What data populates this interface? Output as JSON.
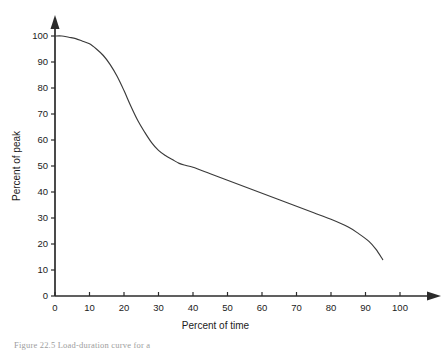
{
  "figure": {
    "caption_partial": "Figure 22.5   Load-duration curve for a",
    "background_color": "#ffffff",
    "line_color": "#3a3a3a",
    "axis_color": "#2b2b2b"
  },
  "chart_data": {
    "type": "line",
    "title": "",
    "subtitle": "",
    "xlabel": "Percent of time",
    "ylabel": "Percent of peak",
    "xlim": [
      0,
      100
    ],
    "ylim": [
      0,
      100
    ],
    "xticks": [
      0,
      10,
      20,
      30,
      40,
      50,
      60,
      70,
      80,
      90,
      100
    ],
    "yticks": [
      0,
      10,
      20,
      30,
      40,
      50,
      60,
      70,
      80,
      90,
      100
    ],
    "xtick_labels": [
      "0",
      "10",
      "20",
      "30",
      "40",
      "50",
      "60",
      "70",
      "80",
      "90",
      "100"
    ],
    "ytick_labels": [
      "0",
      "10",
      "20",
      "30",
      "40",
      "50",
      "60",
      "70",
      "80",
      "90",
      "100"
    ],
    "grid": false,
    "legend": false,
    "legend_position": "none",
    "axis_style": "arrow-tipped",
    "annotations": [],
    "series": [
      {
        "name": "Load duration",
        "x": [
          0,
          2,
          4,
          6,
          8,
          10,
          12,
          14,
          16,
          18,
          20,
          22,
          24,
          26,
          28,
          30,
          32,
          34,
          36,
          38,
          40,
          45,
          50,
          55,
          60,
          65,
          70,
          75,
          80,
          85,
          88,
          91,
          93,
          95
        ],
        "values": [
          100,
          100,
          99.5,
          99,
          98,
          97,
          95,
          92.5,
          89,
          84.5,
          79,
          73,
          67.5,
          63,
          59,
          56,
          54,
          52.5,
          51,
          50.2,
          49.5,
          47,
          44.5,
          42,
          39.5,
          37,
          34.5,
          32,
          29.5,
          26.5,
          24,
          21,
          18,
          14
        ]
      }
    ]
  }
}
